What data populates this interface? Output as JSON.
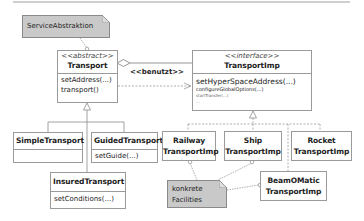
{
  "diagram": {
    "type": "uml-class-diagram",
    "notes": {
      "service_abstraction": "ServiceAbstraktion",
      "concrete_facilities": [
        "konkrete",
        "Facilities"
      ]
    },
    "classes": {
      "transport": {
        "stereotype": "<<abstract>>",
        "name": "Transport",
        "operations": [
          "setAddress(...)",
          "transport()"
        ]
      },
      "transport_imp": {
        "stereotype": "<<interface>>",
        "name": "TransportImp",
        "operations": [
          "setHyperSpaceAddress(...)",
          "configureGlobalOptions(...)",
          "startTransfer(...)",
          "..."
        ]
      },
      "simple_transport": {
        "name": "SimpleTransport",
        "operations": []
      },
      "guided_transport": {
        "name": "GuidedTransport",
        "operations": [
          "setGuide(...)"
        ]
      },
      "insured_transport": {
        "name": "InsuredTransport",
        "operations": [
          "setConditions(...)"
        ]
      },
      "railway_transport_imp": {
        "name_lines": [
          "Railway",
          "TransportImp"
        ]
      },
      "ship_transport_imp": {
        "name_lines": [
          "Ship",
          "TransportImp"
        ]
      },
      "rocket_transport_imp": {
        "name_lines": [
          "Rocket",
          "TransportImp"
        ]
      },
      "beamomatic_transport_imp": {
        "name_lines": [
          "BeamOMatic",
          "TransportImp"
        ]
      }
    },
    "relations": {
      "uses_label": "<<benutzt>>"
    },
    "colors": {
      "note_fill": "#c9c9c9",
      "border": "#9a9a9a",
      "line": "#8a8a8a"
    }
  }
}
